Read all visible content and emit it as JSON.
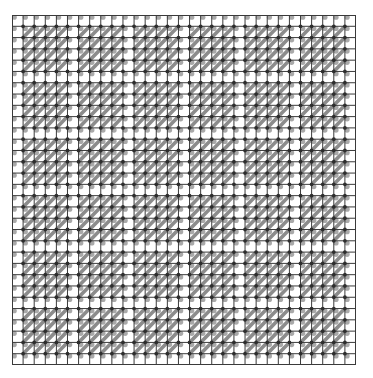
{
  "grid": {
    "rows": 31,
    "cols": 31,
    "blank_period": 5,
    "blank_offset": 0,
    "width": 344,
    "height": 350
  },
  "colors": {
    "background": "#ffffff",
    "grid_line": "#3a3a3a",
    "stripe": "#8c8c8c",
    "node_dot": "#2e2e2e",
    "node_halo": "#9a9a9a"
  }
}
